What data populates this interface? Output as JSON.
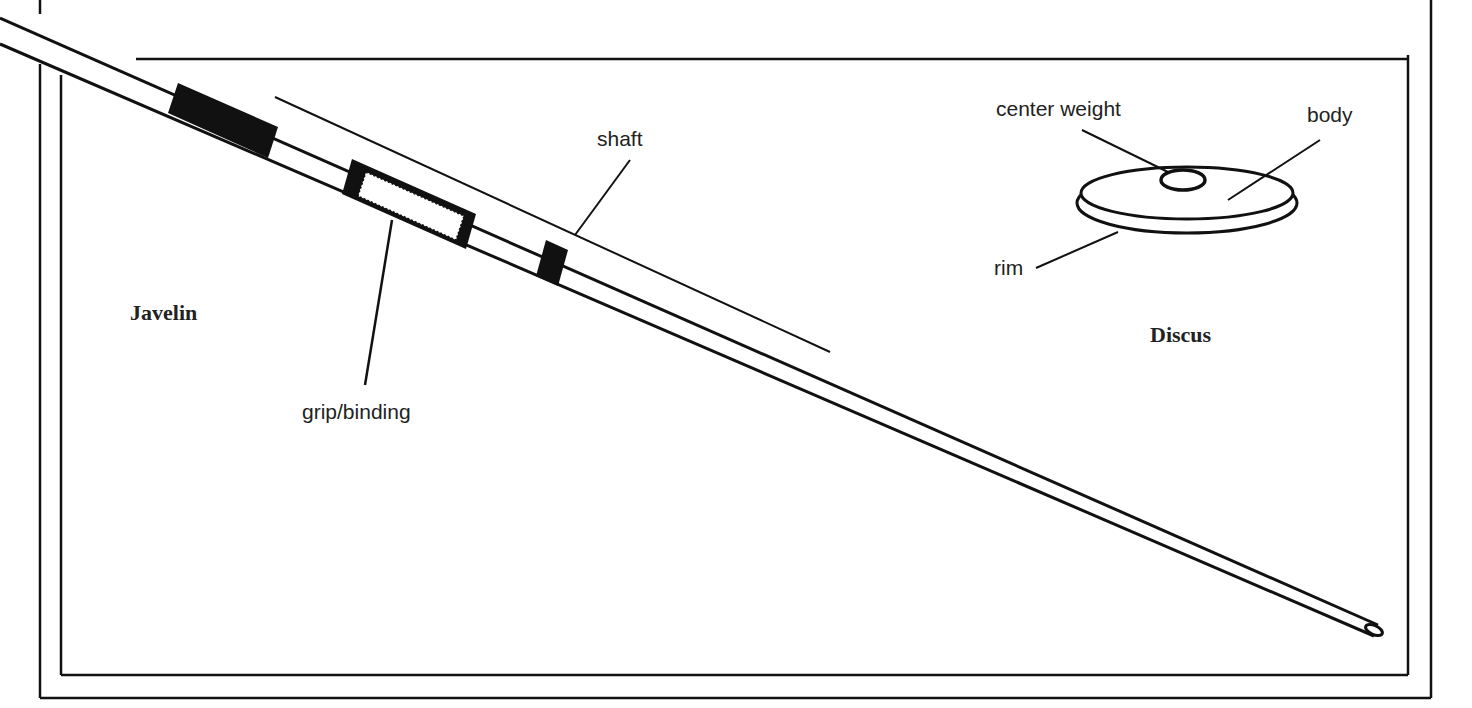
{
  "javelin": {
    "title": "Javelin",
    "labels": {
      "shaft": "shaft",
      "grip": "grip/binding"
    }
  },
  "discus": {
    "title": "Discus",
    "labels": {
      "center_weight": "center weight",
      "body": "body",
      "rim": "rim"
    }
  },
  "colors": {
    "ink": "#111111",
    "background": "#ffffff"
  }
}
